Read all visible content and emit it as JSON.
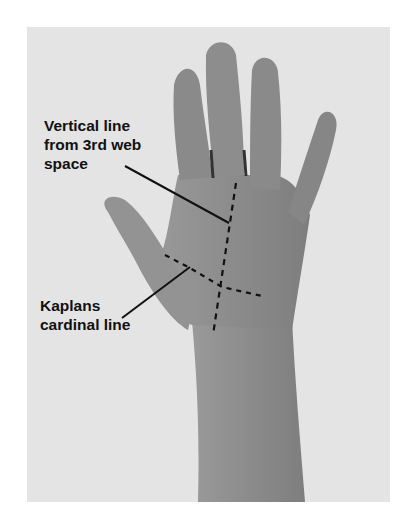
{
  "figure": {
    "background_color": "#e4e4e4",
    "skin_color": "#8f8f8f",
    "annotations": [
      {
        "id": "vertical-line",
        "text": "Vertical line\nfrom 3rd web\nspace"
      },
      {
        "id": "kaplans-line",
        "text": "Kaplans\ncardinal line"
      }
    ]
  }
}
